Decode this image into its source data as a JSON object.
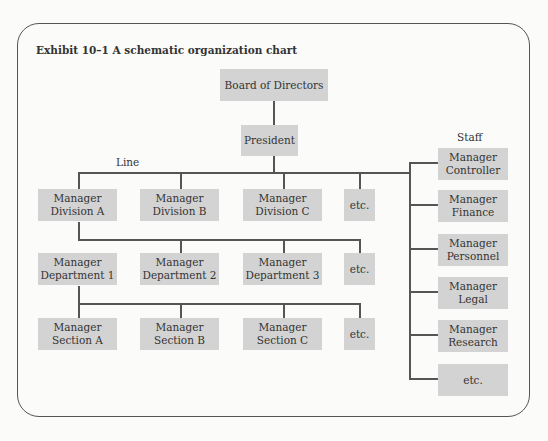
{
  "title": "Exhibit 10–1 A schematic organization chart",
  "labels": {
    "line": "Line",
    "staff": "Staff"
  },
  "top": {
    "board": "Board of Directors",
    "president": "President"
  },
  "line_rows": [
    {
      "row": "division",
      "boxes": [
        {
          "l1": "Manager",
          "l2": "Division A"
        },
        {
          "l1": "Manager",
          "l2": "Division B"
        },
        {
          "l1": "Manager",
          "l2": "Division C"
        },
        {
          "l1": "etc.",
          "l2": ""
        }
      ]
    },
    {
      "row": "department",
      "boxes": [
        {
          "l1": "Manager",
          "l2": "Department 1"
        },
        {
          "l1": "Manager",
          "l2": "Department 2"
        },
        {
          "l1": "Manager",
          "l2": "Department 3"
        },
        {
          "l1": "etc.",
          "l2": ""
        }
      ]
    },
    {
      "row": "section",
      "boxes": [
        {
          "l1": "Manager",
          "l2": "Section A"
        },
        {
          "l1": "Manager",
          "l2": "Section B"
        },
        {
          "l1": "Manager",
          "l2": "Section C"
        },
        {
          "l1": "etc.",
          "l2": ""
        }
      ]
    }
  ],
  "staff": [
    {
      "l1": "Manager",
      "l2": "Controller"
    },
    {
      "l1": "Manager",
      "l2": "Finance"
    },
    {
      "l1": "Manager",
      "l2": "Personnel"
    },
    {
      "l1": "Manager",
      "l2": "Legal"
    },
    {
      "l1": "Manager",
      "l2": "Research"
    },
    {
      "l1": "etc.",
      "l2": ""
    }
  ]
}
